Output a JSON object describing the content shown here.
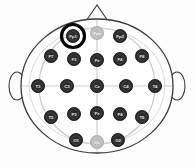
{
  "figure": {
    "type": "eeg-electrode-montage",
    "orientation": "nose at top, left ear at left, right ear at right",
    "head_outline_color": "#3a3a3a",
    "inner_circle_color": "#c9c9c9",
    "crosshair_color": "#cfcfcf",
    "electrode_active_color": "#2b2b2b",
    "electrode_inactive_color": "#bcbcbc",
    "electrode_label_color": "#e8e8e8",
    "highlight_ring_color": "#000000",
    "background_color": "#fdfdfd"
  },
  "anatomy": {
    "nose_name": "nose-marker",
    "left_ear_name": "left-ear-marker",
    "right_ear_name": "right-ear-marker"
  },
  "highlight": {
    "electrode": "Fp1",
    "cx": 73,
    "cy": 36,
    "radius": 11.5,
    "stroke_width": 3.2,
    "description": "thick black ring highlighting the Fp1 electrode"
  },
  "electrodes": [
    {
      "label": "Fp1",
      "cx": 73,
      "cy": 36,
      "state": "active",
      "row": "prefrontal"
    },
    {
      "label": "Fpz",
      "cx": 97,
      "cy": 33,
      "state": "inactive",
      "row": "prefrontal"
    },
    {
      "label": "Fp2",
      "cx": 120,
      "cy": 36,
      "state": "active",
      "row": "prefrontal"
    },
    {
      "label": "F7",
      "cx": 51,
      "cy": 56,
      "state": "active",
      "row": "frontal"
    },
    {
      "label": "F3",
      "cx": 74,
      "cy": 59,
      "state": "active",
      "row": "frontal"
    },
    {
      "label": "Fz",
      "cx": 97,
      "cy": 60,
      "state": "active",
      "row": "frontal"
    },
    {
      "label": "F4",
      "cx": 120,
      "cy": 59,
      "state": "active",
      "row": "frontal"
    },
    {
      "label": "F8",
      "cx": 142,
      "cy": 56,
      "state": "active",
      "row": "frontal"
    },
    {
      "label": "T3",
      "cx": 38,
      "cy": 86,
      "state": "active",
      "row": "central"
    },
    {
      "label": "C3",
      "cx": 67,
      "cy": 86,
      "state": "active",
      "row": "central"
    },
    {
      "label": "Cz",
      "cx": 97,
      "cy": 86,
      "state": "active",
      "row": "central"
    },
    {
      "label": "C4",
      "cx": 126,
      "cy": 86,
      "state": "active",
      "row": "central"
    },
    {
      "label": "T4",
      "cx": 155,
      "cy": 86,
      "state": "active",
      "row": "central"
    },
    {
      "label": "T5",
      "cx": 51,
      "cy": 117,
      "state": "active",
      "row": "parietal"
    },
    {
      "label": "P3",
      "cx": 74,
      "cy": 114,
      "state": "active",
      "row": "parietal"
    },
    {
      "label": "Pz",
      "cx": 97,
      "cy": 113,
      "state": "active",
      "row": "parietal"
    },
    {
      "label": "P4",
      "cx": 120,
      "cy": 114,
      "state": "active",
      "row": "parietal"
    },
    {
      "label": "T6",
      "cx": 142,
      "cy": 117,
      "state": "active",
      "row": "parietal"
    },
    {
      "label": "O1",
      "cx": 76,
      "cy": 140,
      "state": "active",
      "row": "occipital"
    },
    {
      "label": "Oz",
      "cx": 97,
      "cy": 142,
      "state": "inactive",
      "row": "occipital"
    },
    {
      "label": "O2",
      "cx": 118,
      "cy": 140,
      "state": "active",
      "row": "occipital"
    }
  ]
}
